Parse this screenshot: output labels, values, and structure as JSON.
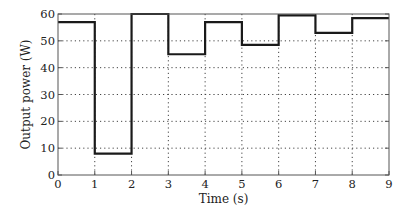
{
  "chart_data": {
    "type": "line",
    "subtype": "step",
    "title": "",
    "xlabel": "Time (s)",
    "ylabel": "Output power (W)",
    "xlim": [
      0,
      9
    ],
    "ylim": [
      0,
      60
    ],
    "xticks": [
      0,
      1,
      2,
      3,
      4,
      5,
      6,
      7,
      8,
      9
    ],
    "yticks": [
      0,
      10,
      20,
      30,
      40,
      50,
      60
    ],
    "grid": true,
    "grid_style": "dotted",
    "legend": null,
    "series": [
      {
        "name": "Output power",
        "color": "#1a1a1a",
        "steps": [
          {
            "t_start": 0,
            "t_end": 1,
            "value": 57
          },
          {
            "t_start": 1,
            "t_end": 2,
            "value": 8
          },
          {
            "t_start": 2,
            "t_end": 3,
            "value": 60
          },
          {
            "t_start": 3,
            "t_end": 4,
            "value": 45
          },
          {
            "t_start": 4,
            "t_end": 5,
            "value": 57
          },
          {
            "t_start": 5,
            "t_end": 6,
            "value": 48.5
          },
          {
            "t_start": 6,
            "t_end": 7,
            "value": 59.5
          },
          {
            "t_start": 7,
            "t_end": 8,
            "value": 53
          },
          {
            "t_start": 8,
            "t_end": 9,
            "value": 58.5
          }
        ]
      }
    ]
  },
  "axes": {
    "xlabel": "Time (s)",
    "ylabel": "Output power (W)",
    "xtick_labels": [
      "0",
      "1",
      "2",
      "3",
      "4",
      "5",
      "6",
      "7",
      "8",
      "9"
    ],
    "ytick_labels": [
      "0",
      "10",
      "20",
      "30",
      "40",
      "50",
      "60"
    ]
  },
  "colors": {
    "line": "#1a1a1a",
    "axes": "#555555",
    "grid": "#444444",
    "text": "#222222"
  }
}
